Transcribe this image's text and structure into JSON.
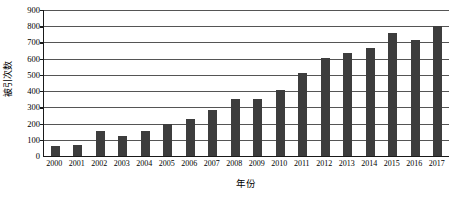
{
  "chart_data": {
    "type": "bar",
    "title": "",
    "xlabel": "年份",
    "ylabel": "被引次数",
    "categories": [
      "2000",
      "2001",
      "2002",
      "2003",
      "2004",
      "2005",
      "2006",
      "2007",
      "2008",
      "2009",
      "2010",
      "2011",
      "2012",
      "2013",
      "2014",
      "2015",
      "2016",
      "2017"
    ],
    "values": [
      60,
      70,
      155,
      125,
      155,
      200,
      230,
      282,
      350,
      353,
      405,
      510,
      602,
      635,
      668,
      760,
      718,
      800
    ],
    "series": [
      {
        "name": "被引次数",
        "values": [
          60,
          70,
          155,
          125,
          155,
          200,
          230,
          282,
          350,
          353,
          405,
          510,
          602,
          635,
          668,
          760,
          718,
          800
        ]
      }
    ],
    "ylim": [
      0,
      900
    ],
    "ytick_labels": [
      "900",
      "800",
      "700",
      "600",
      "500",
      "400",
      "300",
      "200",
      "100",
      "0"
    ],
    "ytick_values": [
      900,
      800,
      700,
      600,
      500,
      400,
      300,
      200,
      100,
      0
    ],
    "ytick_step": 100,
    "xlim_categories_count": 18,
    "grid": true,
    "grid_axis": "y",
    "legend": false,
    "legend_position": "none",
    "bar_color": "#3d3d3d",
    "axis_color": "#1a1a1a",
    "grid_color": "#555555",
    "background_color": "#ffffff"
  }
}
